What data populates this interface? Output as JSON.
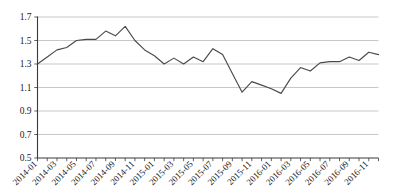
{
  "chart_data": {
    "type": "line",
    "title": "",
    "subtitle": "",
    "xlabel": "",
    "ylabel": "",
    "grid": true,
    "legend": false,
    "legend_position": "none",
    "ylim": [
      0.5,
      1.7
    ],
    "ytick_values": [
      0.5,
      0.7,
      0.9,
      1.1,
      1.3,
      1.5,
      1.7
    ],
    "ytick_labels": [
      "0.5",
      "0.7",
      "0.9",
      "1.1",
      "1.3",
      "1.5",
      "1.7"
    ],
    "x": [
      "2014-01",
      "2014-02",
      "2014-03",
      "2014-04",
      "2014-05",
      "2014-06",
      "2014-07",
      "2014-08",
      "2014-09",
      "2014-10",
      "2014-11",
      "2014-12",
      "2015-01",
      "2015-02",
      "2015-03",
      "2015-04",
      "2015-05",
      "2015-06",
      "2015-07",
      "2015-08",
      "2015-09",
      "2015-10",
      "2015-11",
      "2015-12",
      "2016-01",
      "2016-02",
      "2016-03",
      "2016-04",
      "2016-05",
      "2016-06",
      "2016-07",
      "2016-08",
      "2016-09",
      "2016-10",
      "2016-11",
      "2016-12"
    ],
    "xtick_labels": [
      "2014-01",
      "2014-03",
      "2014-05",
      "2014-07",
      "2014-09",
      "2014-11",
      "2015-01",
      "2015-03",
      "2015-05",
      "2015-07",
      "2015-09",
      "2015-11",
      "2016-01",
      "2016-03",
      "2016-05",
      "2016-07",
      "2016-09",
      "2016-11"
    ],
    "xtick_label_interval_months": 2,
    "xtick_label_rotation_deg": -45,
    "values": [
      1.3,
      1.36,
      1.42,
      1.44,
      1.5,
      1.51,
      1.51,
      1.58,
      1.54,
      1.62,
      1.5,
      1.42,
      1.37,
      1.3,
      1.35,
      1.3,
      1.36,
      1.32,
      1.43,
      1.38,
      1.22,
      1.06,
      1.15,
      1.12,
      1.09,
      1.05,
      1.18,
      1.27,
      1.24,
      1.31,
      1.32,
      1.32,
      1.36,
      1.33,
      1.4,
      1.38
    ],
    "series": [
      {
        "name": "series-1",
        "color": "#4a4a4a",
        "values": [
          1.3,
          1.36,
          1.42,
          1.44,
          1.5,
          1.51,
          1.51,
          1.58,
          1.54,
          1.62,
          1.5,
          1.42,
          1.37,
          1.3,
          1.35,
          1.3,
          1.36,
          1.32,
          1.43,
          1.38,
          1.22,
          1.06,
          1.15,
          1.12,
          1.09,
          1.05,
          1.18,
          1.27,
          1.24,
          1.31,
          1.32,
          1.32,
          1.36,
          1.33,
          1.4,
          1.38
        ]
      }
    ],
    "colors": {
      "line": "#4a4a4a",
      "grid": "#b9b9b9",
      "axis": "#3a3a3a",
      "background": "#ffffff",
      "text": "#1a1a1a"
    }
  }
}
